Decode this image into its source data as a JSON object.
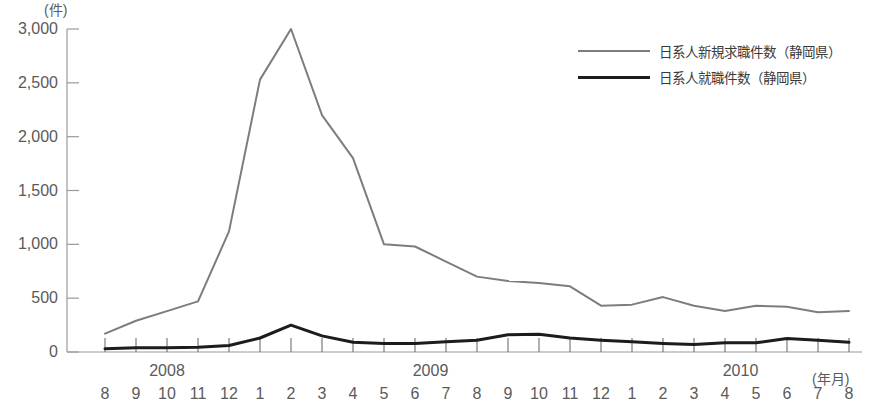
{
  "chart_data": {
    "type": "line",
    "title": "",
    "xlabel": "(年月)",
    "ylabel": "(件)",
    "ylim": [
      0,
      3000
    ],
    "yticks": [
      "0",
      "500",
      "1,000",
      "1,500",
      "2,000",
      "2,500",
      "3,000"
    ],
    "ytick_values": [
      0,
      500,
      1000,
      1500,
      2000,
      2500,
      3000
    ],
    "grid": false,
    "legend_position": "top-right",
    "x": [
      "2008/8",
      "2008/9",
      "2008/10",
      "2008/11",
      "2008/12",
      "2009/1",
      "2009/2",
      "2009/3",
      "2009/4",
      "2009/5",
      "2009/6",
      "2009/7",
      "2009/8",
      "2009/9",
      "2009/10",
      "2009/11",
      "2009/12",
      "2010/1",
      "2010/2",
      "2010/3",
      "2010/4",
      "2010/5",
      "2010/6",
      "2010/7",
      "2010/8"
    ],
    "x_months": [
      "8",
      "9",
      "10",
      "11",
      "12",
      "1",
      "2",
      "3",
      "4",
      "5",
      "6",
      "7",
      "8",
      "9",
      "10",
      "11",
      "12",
      "1",
      "2",
      "3",
      "4",
      "5",
      "6",
      "7",
      "8"
    ],
    "x_years": [
      {
        "label": "2008",
        "index": 0,
        "span": 5
      },
      {
        "label": "2009",
        "index": 5,
        "span": 12
      },
      {
        "label": "2010",
        "index": 17,
        "span": 8
      }
    ],
    "series": [
      {
        "name": "日系人新規求職件数（静岡県）",
        "color": "#7d7d7d",
        "width": 2,
        "values": [
          170,
          290,
          380,
          470,
          1120,
          2530,
          3000,
          2200,
          1800,
          1000,
          980,
          840,
          700,
          660,
          640,
          610,
          430,
          440,
          510,
          430,
          380,
          430,
          420,
          370,
          380
        ]
      },
      {
        "name": "日系人就職件数（静岡県）",
        "color": "#1c1c1c",
        "width": 3,
        "values": [
          30,
          40,
          40,
          45,
          60,
          130,
          250,
          150,
          90,
          80,
          80,
          95,
          110,
          160,
          165,
          130,
          110,
          95,
          80,
          70,
          85,
          85,
          125,
          110,
          90
        ]
      }
    ]
  },
  "axis": {
    "unit_y": "(件)",
    "unit_x": "(年月)"
  }
}
